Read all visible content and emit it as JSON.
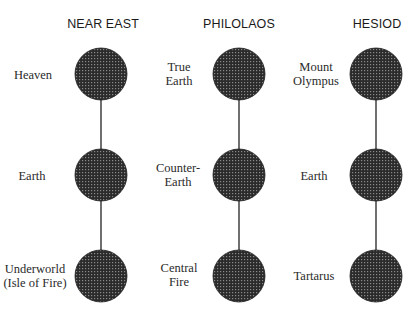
{
  "diagram": {
    "columns": [
      {
        "title": "NEAR EAST",
        "circle_x": 101,
        "label_x": 33,
        "nodes": [
          {
            "lines": [
              "Heaven"
            ]
          },
          {
            "lines": [
              "Earth"
            ]
          },
          {
            "lines": [
              "Underworld",
              "(Isle of Fire)"
            ]
          }
        ]
      },
      {
        "title": "PHILOLAOS",
        "circle_x": 239,
        "label_x": 179,
        "nodes": [
          {
            "lines": [
              "True",
              "Earth"
            ]
          },
          {
            "lines": [
              "Counter-",
              "Earth"
            ]
          },
          {
            "lines": [
              "Central",
              "Fire"
            ]
          }
        ]
      },
      {
        "title": "HESIOD",
        "circle_x": 376,
        "label_x": 314,
        "nodes": [
          {
            "lines": [
              "Mount",
              "Olympus"
            ]
          },
          {
            "lines": [
              "Earth"
            ]
          },
          {
            "lines": [
              "Tartarus"
            ]
          }
        ]
      }
    ],
    "row_y": [
      74,
      175,
      276
    ],
    "circle_radius": 26,
    "colors": {
      "circle_fill": "#2b2b2b",
      "dot_pattern": "#8a8a8a",
      "connector": "#222222",
      "title_text": "#1a1a1a",
      "label_text": "#2a2a2a"
    }
  }
}
